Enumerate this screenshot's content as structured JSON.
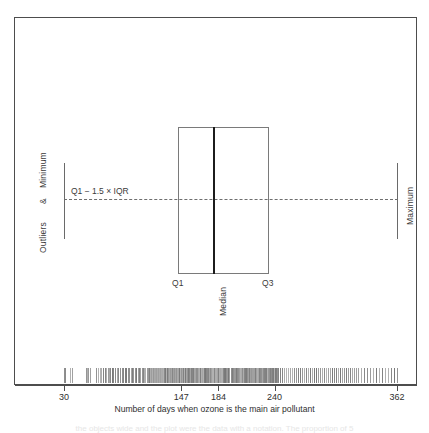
{
  "chart_data": {
    "type": "box",
    "title": "",
    "xlabel": "Number of days when ozone is the main air pollutant",
    "ylabel": "",
    "xlim": [
      20,
      372
    ],
    "grid": false,
    "legend": "none",
    "tick_labels": [
      "30",
      "147",
      "184",
      "240",
      "362"
    ],
    "tick_values": [
      30,
      147,
      184,
      240,
      362
    ],
    "box": {
      "minimum": 30,
      "q1": 147,
      "median": 184,
      "q3": 240,
      "maximum": 362,
      "lower_fence_label": "Q1 − 1.5 × IQR"
    },
    "annotations": [
      {
        "name": "outliers-minimum",
        "text": "Outliers & Minimum",
        "orientation": "vertical",
        "side": "left"
      },
      {
        "name": "maximum",
        "text": "Maximum",
        "orientation": "vertical",
        "side": "right"
      },
      {
        "name": "lower-fence",
        "text": "Q1 − 1.5 × IQR",
        "orientation": "horizontal"
      },
      {
        "name": "q1",
        "text": "Q1",
        "orientation": "horizontal"
      },
      {
        "name": "median",
        "text": "Median",
        "orientation": "vertical"
      },
      {
        "name": "q3",
        "text": "Q3",
        "orientation": "horizontal"
      }
    ],
    "rug_values": [
      30,
      31,
      36,
      38,
      52,
      53,
      54,
      56,
      62,
      64,
      66,
      67,
      69,
      71,
      72,
      74,
      75,
      76,
      78,
      79,
      81,
      83,
      84,
      86,
      88,
      89,
      91,
      92,
      94,
      95,
      97,
      98,
      99,
      101,
      102,
      104,
      105,
      106,
      108,
      109,
      110,
      111,
      113,
      114,
      115,
      116,
      117,
      118,
      119,
      120,
      121,
      122,
      123,
      124,
      125,
      126,
      127,
      128,
      129,
      130,
      131,
      132,
      133,
      134,
      135,
      136,
      137,
      138,
      139,
      140,
      141,
      142,
      143,
      144,
      145,
      146,
      147,
      148,
      149,
      150,
      151,
      152,
      153,
      154,
      155,
      156,
      157,
      158,
      159,
      160,
      161,
      162,
      163,
      164,
      165,
      166,
      167,
      168,
      169,
      170,
      171,
      172,
      173,
      174,
      175,
      176,
      177,
      178,
      179,
      180,
      181,
      182,
      183,
      184,
      185,
      186,
      187,
      188,
      189,
      190,
      191,
      192,
      193,
      194,
      195,
      196,
      197,
      198,
      199,
      200,
      201,
      202,
      203,
      204,
      205,
      206,
      207,
      208,
      209,
      210,
      211,
      212,
      213,
      214,
      215,
      216,
      217,
      218,
      219,
      220,
      221,
      222,
      223,
      224,
      225,
      226,
      227,
      228,
      229,
      230,
      231,
      232,
      233,
      234,
      235,
      236,
      237,
      238,
      239,
      240,
      241,
      242,
      243,
      245,
      247,
      249,
      251,
      253,
      255,
      257,
      259,
      261,
      263,
      265,
      267,
      269,
      271,
      273,
      275,
      277,
      279,
      281,
      283,
      285,
      287,
      289,
      291,
      293,
      295,
      297,
      299,
      301,
      303,
      305,
      307,
      309,
      311,
      313,
      315,
      317,
      319,
      321,
      323,
      326,
      329,
      332,
      335,
      338,
      341,
      344,
      347,
      350,
      353,
      356,
      359,
      362
    ]
  },
  "labels": {
    "outliers_minimum": "Outliers  &  Minimum",
    "outliers": "Outliers",
    "ampersand": "&",
    "minimum": "Minimum",
    "maximum": "Maximum",
    "lower_fence": "Q1 − 1.5 × IQR",
    "q1": "Q1",
    "median": "Median",
    "q3": "Q3",
    "axis_title": "Number of days when ozone is the main air pollutant"
  },
  "axis": {
    "ticks": [
      {
        "label": "30",
        "value": 30
      },
      {
        "label": "147",
        "value": 147
      },
      {
        "label": "184",
        "value": 184
      },
      {
        "label": "240",
        "value": 240
      },
      {
        "label": "362",
        "value": 362
      }
    ]
  },
  "colors": {
    "frame": "#4d4d4d",
    "box_stroke": "#7a7a7a",
    "median": "#1c1c1c",
    "whisker": "#6a6a6a",
    "dashed": "#6e6e6e",
    "rug": "#8a8a8a",
    "text": "#2f2f2f",
    "background": "#ffffff"
  },
  "caption_ghost": "the objects wide and the plot were the data with a notation. The proportion of 5"
}
